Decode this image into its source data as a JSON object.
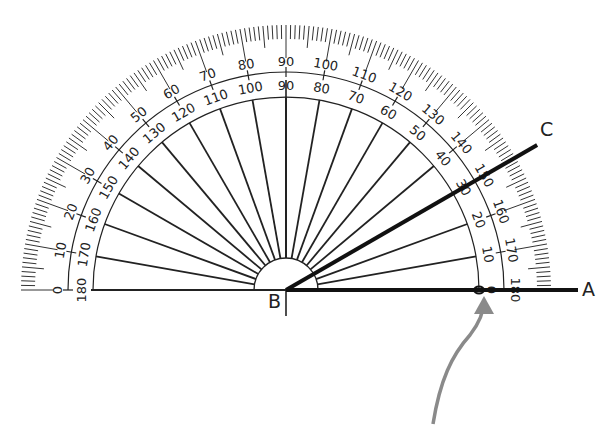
{
  "diagram": {
    "type": "protractor-angle-measurement",
    "center_label": "B",
    "ray_labels": {
      "a": "A",
      "c": "C"
    },
    "angle_ABC_deg": 30,
    "outer_scale_labels": [
      "0",
      "10",
      "20",
      "30",
      "40",
      "50",
      "60",
      "70",
      "80",
      "90",
      "100",
      "110",
      "120",
      "130",
      "140",
      "150",
      "160",
      "170",
      "180"
    ],
    "inner_scale_labels": [
      "180",
      "170",
      "160",
      "150",
      "140",
      "130",
      "120",
      "110",
      "100",
      "90",
      "80",
      "70",
      "60",
      "50",
      "40",
      "30",
      "20",
      "10",
      "0"
    ],
    "arrow": {
      "points_to": "zero mark of inner scale on ray BA",
      "color": "#888888"
    },
    "colors": {
      "ink": "#222222",
      "ray": "#111111",
      "arrow": "#8a8a8a",
      "background": "#ffffff"
    }
  },
  "labels": {
    "A": "A",
    "B": "B",
    "C": "C"
  }
}
